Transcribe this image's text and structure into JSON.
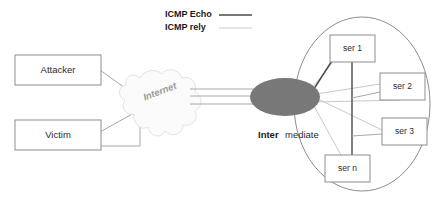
{
  "legend": {
    "items": [
      {
        "label": "ICMP Echo",
        "line_style": "solid-dark",
        "color": "#4a4a4a"
      },
      {
        "label": "ICMP rely",
        "line_style": "solid-light",
        "color": "#c9c9c9"
      }
    ]
  },
  "nodes": {
    "attacker": {
      "label": "Attacker"
    },
    "victim": {
      "label": "Victim"
    },
    "cloud": {
      "label": "Internet"
    },
    "intermediate": {
      "label_bold": "Inter",
      "label_plain": "mediate"
    },
    "servers": [
      {
        "label": "ser 1"
      },
      {
        "label": "ser 2"
      },
      {
        "label": "ser 3"
      },
      {
        "label": "ser n"
      }
    ]
  },
  "colors": {
    "intermediate_fill": "#787878",
    "box_stroke": "#8d8d8d",
    "echo_line": "#4a4a4a",
    "rely_line": "#c9c9c9",
    "cloud_text": "#9a9a9a",
    "background": "#ffffff"
  }
}
